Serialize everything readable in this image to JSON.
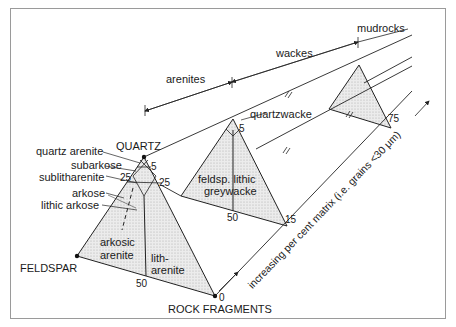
{
  "diagram": {
    "end_members": {
      "quartz": "QUARTZ",
      "feldspar": "FELDSPAR",
      "rock_fragments": "ROCK FRAGMENTS"
    },
    "groups": {
      "arenites": "arenites",
      "wackes": "wackes",
      "mudrocks": "mudrocks"
    },
    "rock_names": {
      "quartz_arenite": "quartz arenite",
      "subarkose": "subarkose",
      "sublitharenite": "sublitharenite",
      "arkose": "arkose",
      "lithic_arkose": "lithic arkose",
      "arkosic_arenite_1": "arkosic",
      "arkosic_arenite_2": "arenite",
      "litharenite_1": "lith-",
      "litharenite_2": "arenite",
      "quartzwacke": "quartzwacke",
      "greywacke_1": "feldsp. lithic",
      "greywacke_2": "greywacke"
    },
    "numbers": {
      "front_5": "5",
      "front_25_left": "25",
      "front_25_right": "25",
      "front_50": "50",
      "front_0": "0",
      "mid_5": "5",
      "mid_50": "50",
      "mid_15": "15",
      "back_75": "75"
    },
    "axis_label": "increasing per cent matrix (i.e. grains <30 μm)"
  },
  "colors": {
    "line": "#222222",
    "fill": "#e4e4e4",
    "frame": "#9a9a9a"
  }
}
